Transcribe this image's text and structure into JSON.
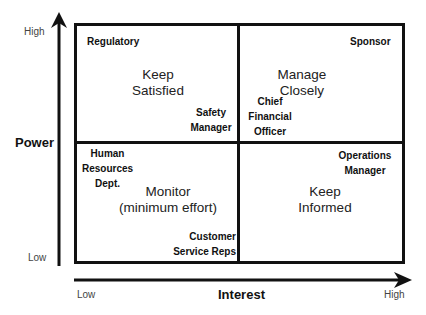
{
  "axes": {
    "y": {
      "title": "Power",
      "high_label": "High",
      "low_label": "Low"
    },
    "x": {
      "title": "Interest",
      "low_label": "Low",
      "high_label": "High"
    }
  },
  "quadrants": {
    "top_left": {
      "strategy": [
        "Keep",
        "Satisfied"
      ],
      "stakeholders": [
        {
          "lines": [
            "Regulatory"
          ]
        },
        {
          "lines": [
            "Safety",
            "Manager"
          ]
        }
      ]
    },
    "top_right": {
      "strategy": [
        "Manage",
        "Closely"
      ],
      "stakeholders": [
        {
          "lines": [
            "Sponsor"
          ]
        },
        {
          "lines": [
            "Chief",
            "Financial",
            "Officer"
          ]
        }
      ]
    },
    "bottom_left": {
      "strategy": [
        "Monitor",
        "(minimum effort)"
      ],
      "stakeholders": [
        {
          "lines": [
            "Human",
            "Resources",
            "Dept."
          ]
        },
        {
          "lines": [
            "Customer",
            "Service Reps"
          ]
        }
      ]
    },
    "bottom_right": {
      "strategy": [
        "Keep",
        "Informed"
      ],
      "stakeholders": [
        {
          "lines": [
            "Operations",
            "Manager"
          ]
        }
      ]
    }
  },
  "colors": {
    "line": "#111111",
    "text": "#222222",
    "background": "#ffffff"
  }
}
